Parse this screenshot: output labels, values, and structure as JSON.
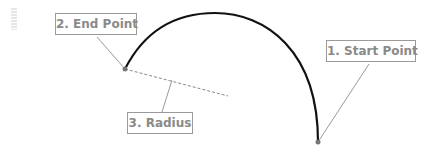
{
  "diagram": {
    "type": "arc-construction",
    "labels": {
      "end_point": "2. End Point",
      "start_point": "1. Start Point",
      "radius": "3. Radius"
    },
    "colors": {
      "arc": "#111111",
      "leader": "#9a9a9a",
      "point": "#777777",
      "label_text": "#8a8a8a"
    },
    "points": {
      "end": {
        "x": 125,
        "y": 69
      },
      "start": {
        "x": 318,
        "y": 142
      }
    }
  }
}
